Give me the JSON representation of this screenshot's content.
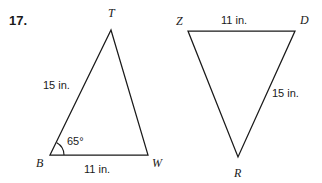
{
  "problem": {
    "number_label": "17."
  },
  "colors": {
    "ink": "#1a1a1a",
    "background": "#ffffff"
  },
  "figures": [
    {
      "name": "triangle-btw",
      "vertices": [
        {
          "label": "T",
          "x": 111,
          "y": 30,
          "label_x": 108,
          "label_y": 17
        },
        {
          "label": "B",
          "x": 50,
          "y": 155,
          "label_x": 36,
          "label_y": 167
        },
        {
          "label": "W",
          "x": 148,
          "y": 155,
          "label_x": 152,
          "label_y": 167
        }
      ],
      "side_labels": [
        {
          "text": "15 in.",
          "x": 43,
          "y": 89,
          "anchor": "start"
        },
        {
          "text": "11 in.",
          "x": 84,
          "y": 173,
          "anchor": "start"
        }
      ],
      "angle_labels": [
        {
          "text": "65°",
          "x": 67,
          "y": 145,
          "anchor": "start",
          "at_vertex": "B"
        }
      ]
    },
    {
      "name": "triangle-zdr",
      "vertices": [
        {
          "label": "Z",
          "x": 188,
          "y": 31,
          "label_x": 176,
          "label_y": 25
        },
        {
          "label": "D",
          "x": 295,
          "y": 31,
          "label_x": 300,
          "label_y": 24
        },
        {
          "label": "R",
          "x": 238,
          "y": 157,
          "label_x": 234,
          "label_y": 177
        }
      ],
      "side_labels": [
        {
          "text": "11 in.",
          "x": 221,
          "y": 24,
          "anchor": "start"
        },
        {
          "text": "15 in.",
          "x": 272,
          "y": 97,
          "anchor": "start"
        }
      ],
      "angle_labels": []
    }
  ]
}
